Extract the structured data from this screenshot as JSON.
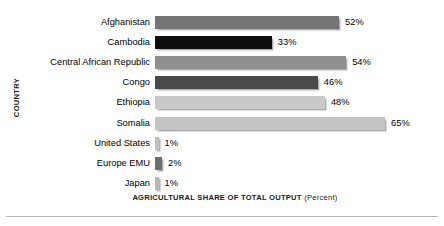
{
  "chart_data": {
    "type": "bar",
    "orientation": "horizontal",
    "title": "",
    "xlabel": "AGRICULTURAL SHARE OF TOTAL OUTPUT",
    "xlabel_unit": "(Percent)",
    "ylabel": "COUNTRY",
    "xlim": [
      0,
      70
    ],
    "grid": false,
    "legend": "none",
    "value_suffix": "%",
    "categories": [
      "Afghanistan",
      "Cambodia",
      "Central African Republic",
      "Congo",
      "Ethiopia",
      "Somalia",
      "United States",
      "Europe EMU",
      "Japan"
    ],
    "values": [
      52,
      33,
      54,
      46,
      48,
      65,
      1,
      2,
      1
    ],
    "value_labels": [
      "52%",
      "33%",
      "54%",
      "46%",
      "48%",
      "65%",
      "1%",
      "2%",
      "1%"
    ],
    "bar_colors": [
      "#757575",
      "#0d0d0d",
      "#8f8f8f",
      "#4a4a4a",
      "#c9c9c9",
      "#c4c4c4",
      "#c0c0c0",
      "#6e6e6e",
      "#b8b8b8"
    ]
  }
}
